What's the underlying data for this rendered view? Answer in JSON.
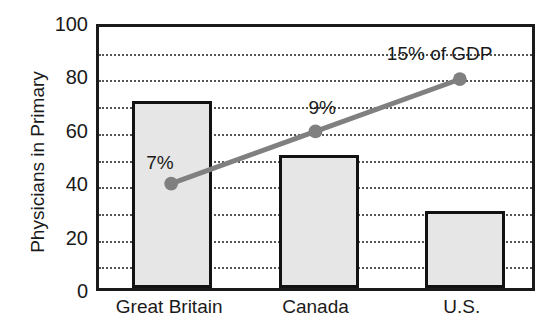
{
  "chart_data": {
    "type": "bar",
    "title": "",
    "subtitle": "",
    "xlabel": "",
    "ylabel": "Physicians in Primary",
    "categories": [
      "Great Britain",
      "Canada",
      "U.S."
    ],
    "ylim": [
      0,
      100
    ],
    "y_ticks": [
      0,
      20,
      40,
      60,
      80,
      100
    ],
    "y_tick_labels": [
      "0",
      "20",
      "40",
      "60",
      "80",
      "100"
    ],
    "gridlines": {
      "visible": true,
      "style": "dotted",
      "values": [
        10,
        20,
        30,
        40,
        50,
        60,
        70,
        80,
        90
      ]
    },
    "legend": {
      "visible": false,
      "position": "none"
    },
    "series": [
      {
        "name": "Physicians in Primary Care",
        "type": "bar",
        "values": [
          70,
          50,
          29
        ],
        "fill_color": "#e6e6e6",
        "edge_color": "#121212"
      },
      {
        "name": "Health spending share of GDP",
        "type": "line",
        "values": [
          40,
          60,
          80
        ],
        "line_color": "#808080",
        "marker": "circle",
        "point_labels": [
          "7%",
          "9%",
          "15% of GDP"
        ]
      }
    ],
    "annotations": [
      {
        "text": "7%",
        "x_category": "Great Britain",
        "y_value": 40
      },
      {
        "text": "9%",
        "x_category": "Canada",
        "y_value": 60
      },
      {
        "text": "15% of GDP",
        "x_category": "U.S.",
        "y_value": 80
      }
    ],
    "colors": {
      "bar_fill": "#e6e6e6",
      "bar_edge": "#121212",
      "line": "#808080",
      "grid": "#555555",
      "axis": "#1a1a1a",
      "background": "#ffffff"
    }
  }
}
